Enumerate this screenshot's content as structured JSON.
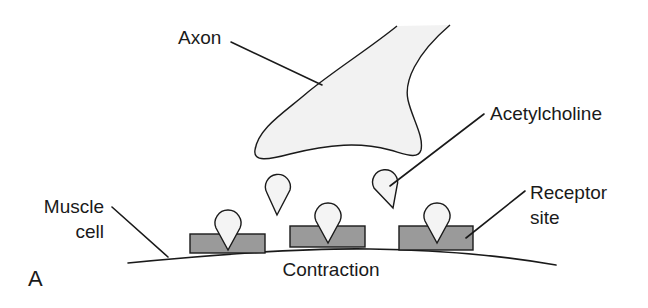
{
  "figure": {
    "panel_letter": "A",
    "colors": {
      "background": "#ffffff",
      "axon_fill": "#f2f2f2",
      "droplet_fill": "#f4f4f4",
      "receptor_fill": "#9a9a9a",
      "stroke": "#1a1a1a"
    },
    "labels": {
      "axon": "Axon",
      "acetylcholine": "Acetylcholine",
      "muscle_cell_line1": "Muscle",
      "muscle_cell_line2": "cell",
      "receptor_site_line1": "Receptor",
      "receptor_site_line2": "site",
      "contraction": "Contraction"
    },
    "components": {
      "axon_terminal": 1,
      "free_acetylcholine_droplets": 2,
      "bound_acetylcholine_droplets": 3,
      "receptor_sites": 3,
      "muscle_membrane": 1
    }
  }
}
